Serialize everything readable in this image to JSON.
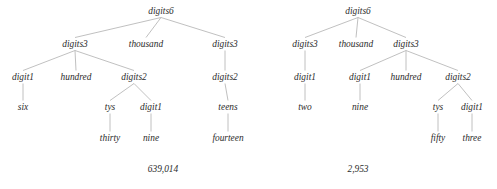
{
  "figure": {
    "kind": "parse-tree-diagram",
    "background_color": "#ffffff",
    "text_color": "#2b2b2b",
    "edge_color": "#b9b9b9",
    "trees": [
      {
        "id": "left-parse-tree",
        "caption": "639,014",
        "caption_x": 163,
        "caption_y": 172,
        "nodes": [
          {
            "id": "l0",
            "label": "digits6",
            "x": 161,
            "y": 14,
            "row": 0
          },
          {
            "id": "l1",
            "label": "digits3",
            "x": 75,
            "y": 47,
            "row": 1
          },
          {
            "id": "l2",
            "label": "thousand",
            "x": 146,
            "y": 47,
            "row": 1
          },
          {
            "id": "l3",
            "label": "digits3",
            "x": 225,
            "y": 47,
            "row": 1
          },
          {
            "id": "l4",
            "label": "digit1",
            "x": 23,
            "y": 80,
            "row": 2
          },
          {
            "id": "l5",
            "label": "hundred",
            "x": 76,
            "y": 80,
            "row": 2
          },
          {
            "id": "l6",
            "label": "digits2",
            "x": 134,
            "y": 80,
            "row": 2
          },
          {
            "id": "l7",
            "label": "digits2",
            "x": 225,
            "y": 80,
            "row": 2
          },
          {
            "id": "l8",
            "label": "six",
            "x": 23,
            "y": 110,
            "row": 3
          },
          {
            "id": "l9",
            "label": "tys",
            "x": 110,
            "y": 110,
            "row": 3
          },
          {
            "id": "l10",
            "label": "digit1",
            "x": 151,
            "y": 110,
            "row": 3
          },
          {
            "id": "l11",
            "label": "teens",
            "x": 228,
            "y": 110,
            "row": 3
          },
          {
            "id": "l12",
            "label": "thirty",
            "x": 110,
            "y": 141,
            "row": 4
          },
          {
            "id": "l13",
            "label": "nine",
            "x": 151,
            "y": 141,
            "row": 4
          },
          {
            "id": "l14",
            "label": "fourteen",
            "x": 228,
            "y": 141,
            "row": 4
          }
        ],
        "edges": [
          [
            "l0",
            "l1"
          ],
          [
            "l0",
            "l2"
          ],
          [
            "l0",
            "l3"
          ],
          [
            "l1",
            "l4"
          ],
          [
            "l1",
            "l5"
          ],
          [
            "l1",
            "l6"
          ],
          [
            "l3",
            "l7"
          ],
          [
            "l4",
            "l8"
          ],
          [
            "l6",
            "l9"
          ],
          [
            "l6",
            "l10"
          ],
          [
            "l7",
            "l11"
          ],
          [
            "l9",
            "l12"
          ],
          [
            "l10",
            "l13"
          ],
          [
            "l11",
            "l14"
          ]
        ]
      },
      {
        "id": "right-parse-tree",
        "caption": "2,953",
        "caption_x": 358,
        "caption_y": 172,
        "nodes": [
          {
            "id": "r0",
            "label": "digits6",
            "x": 358,
            "y": 14,
            "row": 0
          },
          {
            "id": "r1",
            "label": "digits3",
            "x": 305,
            "y": 47,
            "row": 1
          },
          {
            "id": "r2",
            "label": "thousand",
            "x": 356,
            "y": 47,
            "row": 1
          },
          {
            "id": "r3",
            "label": "digits3",
            "x": 406,
            "y": 47,
            "row": 1
          },
          {
            "id": "r4",
            "label": "digit1",
            "x": 305,
            "y": 80,
            "row": 2
          },
          {
            "id": "r5",
            "label": "digit1",
            "x": 360,
            "y": 80,
            "row": 2
          },
          {
            "id": "r6",
            "label": "hundred",
            "x": 406,
            "y": 80,
            "row": 2
          },
          {
            "id": "r7",
            "label": "digits2",
            "x": 458,
            "y": 80,
            "row": 2
          },
          {
            "id": "r8",
            "label": "two",
            "x": 305,
            "y": 110,
            "row": 3
          },
          {
            "id": "r9",
            "label": "nine",
            "x": 360,
            "y": 110,
            "row": 3
          },
          {
            "id": "r10",
            "label": "tys",
            "x": 438,
            "y": 110,
            "row": 3
          },
          {
            "id": "r11",
            "label": "digit1",
            "x": 472,
            "y": 110,
            "row": 3
          },
          {
            "id": "r12",
            "label": "fifty",
            "x": 438,
            "y": 141,
            "row": 4
          },
          {
            "id": "r13",
            "label": "three",
            "x": 472,
            "y": 141,
            "row": 4
          }
        ],
        "edges": [
          [
            "r0",
            "r1"
          ],
          [
            "r0",
            "r2"
          ],
          [
            "r0",
            "r3"
          ],
          [
            "r1",
            "r4"
          ],
          [
            "r3",
            "r5"
          ],
          [
            "r3",
            "r6"
          ],
          [
            "r3",
            "r7"
          ],
          [
            "r4",
            "r8"
          ],
          [
            "r5",
            "r9"
          ],
          [
            "r7",
            "r10"
          ],
          [
            "r7",
            "r11"
          ],
          [
            "r10",
            "r12"
          ],
          [
            "r11",
            "r13"
          ]
        ]
      }
    ]
  }
}
